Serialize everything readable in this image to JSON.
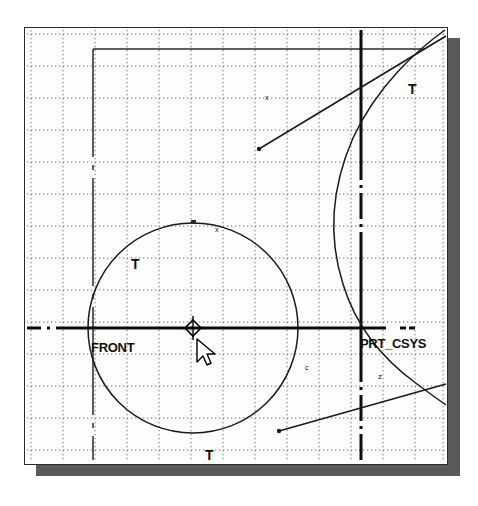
{
  "window": {
    "name": "cad-graphics-window",
    "background_color": "#fdfdfc",
    "border_color": "#2b2b2b",
    "shadow_color": "#5a5a5a"
  },
  "grid": {
    "style": "dotted",
    "spacing_px": 32,
    "color": "#777777"
  },
  "labels": {
    "datum_front": "FRONT",
    "datum_csys": "PRT_CSYS",
    "tangent_top_right": "T",
    "tangent_upper_left": "T",
    "tangent_bottom": "T",
    "marker_c": "c",
    "marker_x": "x",
    "marker_z": "z",
    "marker_top_tick": "x"
  },
  "geometry": {
    "circle": {
      "name": "main-circle",
      "center_x": 192,
      "center_y": 327,
      "radius": 105,
      "color": "#1a1a1a"
    },
    "datum_line_horizontal": {
      "name": "front-datum-line",
      "y": 327,
      "color": "#000000",
      "style": "dash-dot"
    },
    "datum_line_vertical_left": {
      "name": "left-datum-line",
      "x": 92,
      "color": "#2b2b2b",
      "style": "dash-dot"
    },
    "datum_line_vertical_right": {
      "name": "right-datum-line",
      "x": 360,
      "color": "#000000",
      "style": "dash-dot"
    },
    "rect_top_edge_y": 48,
    "arc_right": {
      "name": "right-sweep-arc",
      "color": "#1a1a1a"
    },
    "leader_upper": {
      "name": "upper-leader-line",
      "from_x": 258,
      "from_y": 148,
      "to_x": 470,
      "to_y": 35
    },
    "leader_lower": {
      "name": "lower-leader-line",
      "from_x": 278,
      "from_y": 430,
      "to_x": 470,
      "to_y": 383
    }
  },
  "cursor": {
    "name": "mouse-pointer",
    "x": 196,
    "y": 338
  },
  "csys_marker": {
    "name": "coordinate-system-marker",
    "x": 192,
    "y": 327
  }
}
